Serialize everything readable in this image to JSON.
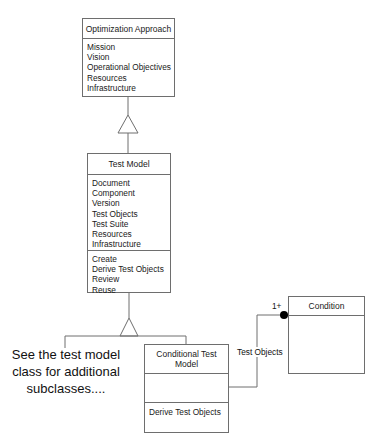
{
  "classes": {
    "optimization_approach": {
      "name": "Optimization Approach",
      "attributes": [
        "Mission",
        "Vision",
        "Operational Objectives",
        "Resources",
        "Infrastructure"
      ]
    },
    "test_model": {
      "name": "Test Model",
      "attributes": [
        "Document",
        "Component",
        "Version",
        "Test Objects",
        "Test Suite",
        "Resources",
        "Infrastructure"
      ],
      "operations": [
        "Create",
        "Derive Test Objects",
        "Review",
        "Reuse"
      ]
    },
    "conditional_test_model": {
      "name": "Conditional Test Model",
      "attributes": [],
      "operations": [
        "Derive Test Objects"
      ]
    },
    "condition": {
      "name": "Condition",
      "attributes": []
    }
  },
  "relationships": [
    {
      "type": "generalization",
      "from": "Test Model",
      "to": "Optimization Approach"
    },
    {
      "type": "generalization",
      "from": "Conditional Test Model",
      "to": "Test Model"
    },
    {
      "type": "association",
      "from": "Conditional Test Model",
      "to": "Condition",
      "label": "Test Objects",
      "multiplicity": "1+"
    }
  ],
  "association": {
    "label": "Test Objects",
    "multiplicity": "1+"
  },
  "note": {
    "text": "See the test model class for additional subclasses...."
  }
}
